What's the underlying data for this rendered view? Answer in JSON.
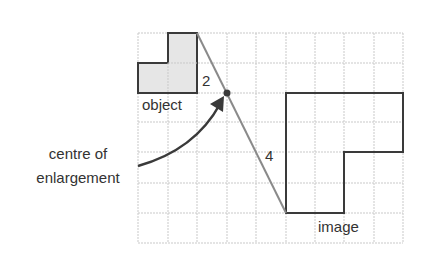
{
  "labels": {
    "object": "object",
    "image": "image",
    "centre_line1": "centre of",
    "centre_line2": "enlargement",
    "dist_object": "2",
    "dist_image": "4"
  },
  "grid": {
    "columns": 9,
    "rows": 7,
    "origin_x": 138,
    "origin_y": 33,
    "cell_w": 29.4,
    "cell_h": 30
  },
  "colors": {
    "grid": "#c9c9c9",
    "outline": "#3a3a3a",
    "ray": "#8a8a8a",
    "object_fill": "#e6e6e6",
    "text": "#333333",
    "arrow": "#3a3a3a"
  },
  "shapes": {
    "object_cells": "L-shape: 3 cells bottom row, 2 cells in top row (columns 1-2), scale factor base",
    "image_scale_factor": "2",
    "centre_grid_point": [
      3,
      2
    ]
  }
}
